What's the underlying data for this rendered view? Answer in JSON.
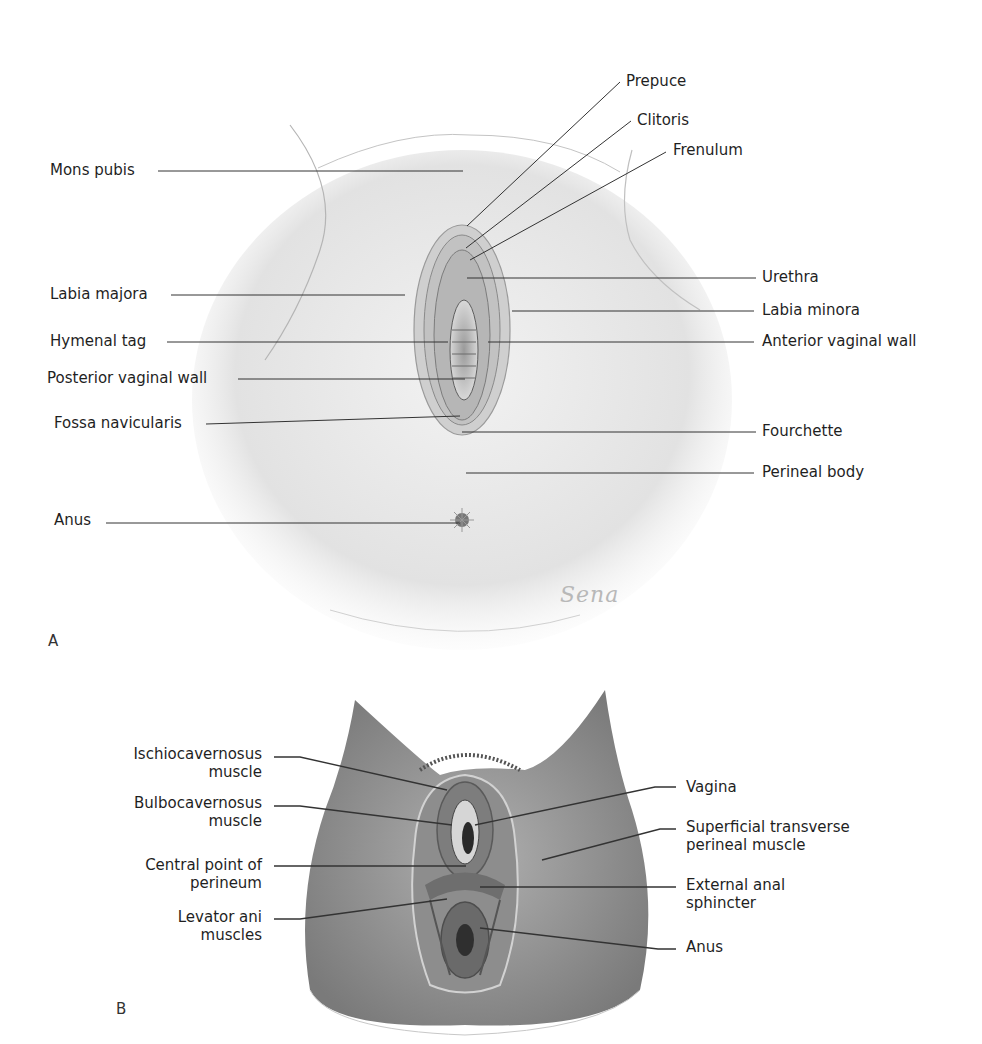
{
  "figure": {
    "panels": [
      {
        "id": "A",
        "letter": "A",
        "signature": "Sena",
        "labels_left": [
          {
            "text": "Mons pubis"
          },
          {
            "text": "Labia majora"
          },
          {
            "text": "Hymenal tag"
          },
          {
            "text": "Posterior vaginal wall"
          },
          {
            "text": "Fossa navicularis"
          },
          {
            "text": "Anus"
          }
        ],
        "labels_right": [
          {
            "text": "Prepuce"
          },
          {
            "text": "Clitoris"
          },
          {
            "text": "Frenulum"
          },
          {
            "text": "Urethra"
          },
          {
            "text": "Labia minora"
          },
          {
            "text": "Anterior vaginal wall"
          },
          {
            "text": "Fourchette"
          },
          {
            "text": "Perineal body"
          }
        ]
      },
      {
        "id": "B",
        "letter": "B",
        "labels_left": [
          {
            "line1": "Ischiocavernosus",
            "line2": "muscle"
          },
          {
            "line1": "Bulbocavernosus",
            "line2": "muscle"
          },
          {
            "line1": "Central point of",
            "line2": "perineum"
          },
          {
            "line1": "Levator ani",
            "line2": "muscles"
          }
        ],
        "labels_right": [
          {
            "line1": "Vagina",
            "line2": ""
          },
          {
            "line1": "Superficial transverse",
            "line2": "perineal muscle"
          },
          {
            "line1": "External anal",
            "line2": "sphincter"
          },
          {
            "line1": "Anus",
            "line2": ""
          }
        ]
      }
    ]
  }
}
